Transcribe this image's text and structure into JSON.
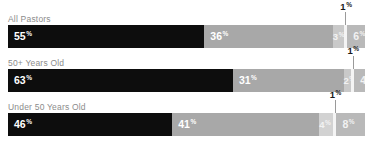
{
  "chart_data": {
    "type": "bar",
    "orientation": "horizontal",
    "stacked": true,
    "title": "",
    "subtitle": "",
    "xlabel": "",
    "ylabel": "",
    "xlim": [
      0,
      100
    ],
    "grid": false,
    "legend_position": "none",
    "units": "%",
    "categories": [
      "All Pastors",
      "50+ Years Old",
      "Under 50 Years Old"
    ],
    "series": [
      {
        "name": "Segment 1",
        "color": "#0d0d0d",
        "values": [
          55,
          63,
          46
        ]
      },
      {
        "name": "Segment 2",
        "color": "#a8a8a8",
        "values": [
          36,
          31,
          41
        ]
      },
      {
        "name": "Segment 3",
        "color": "#c9c9c9",
        "values": [
          3,
          2,
          4
        ]
      },
      {
        "name": "Segment 4",
        "color": "#f4f4f4",
        "values": [
          1,
          1,
          1
        ]
      },
      {
        "name": "Segment 5",
        "color": "#b9b9b9",
        "values": [
          6,
          4,
          8
        ]
      }
    ],
    "annotations": [
      {
        "text": "1%",
        "series": "Segment 4",
        "category": "All Pastors"
      },
      {
        "text": "1%",
        "series": "Segment 4",
        "category": "50+ Years Old"
      },
      {
        "text": "1%",
        "series": "Segment 4",
        "category": "Under 50 Years Old"
      }
    ]
  },
  "rows": [
    {
      "label": "All Pastors",
      "callout": "1",
      "callout_pct": "%",
      "segments": [
        {
          "value": "55",
          "pct": "%",
          "width": 55,
          "color": "#0d0d0d",
          "tone": "dark",
          "show_label": true,
          "narrow": false
        },
        {
          "value": "36",
          "pct": "%",
          "width": 36,
          "color": "#a8a8a8",
          "tone": "light",
          "show_label": true,
          "narrow": false
        },
        {
          "value": "3",
          "pct": "%",
          "width": 3,
          "color": "#c9c9c9",
          "tone": "pale",
          "show_label": true,
          "narrow": true
        },
        {
          "value": "1",
          "pct": "%",
          "width": 1,
          "color": "#f4f4f4",
          "tone": "pale",
          "show_label": false,
          "narrow": true
        },
        {
          "value": "6",
          "pct": "%",
          "width": 6,
          "color": "#b9b9b9",
          "tone": "pale",
          "show_label": true,
          "narrow": false
        }
      ]
    },
    {
      "label": "50+ Years Old",
      "callout": "1",
      "callout_pct": "%",
      "segments": [
        {
          "value": "63",
          "pct": "%",
          "width": 63,
          "color": "#0d0d0d",
          "tone": "dark",
          "show_label": true,
          "narrow": false
        },
        {
          "value": "31",
          "pct": "%",
          "width": 31,
          "color": "#a8a8a8",
          "tone": "light",
          "show_label": true,
          "narrow": false
        },
        {
          "value": "2",
          "pct": "%",
          "width": 2,
          "color": "#c9c9c9",
          "tone": "pale",
          "show_label": true,
          "narrow": true
        },
        {
          "value": "1",
          "pct": "%",
          "width": 1,
          "color": "#f4f4f4",
          "tone": "pale",
          "show_label": false,
          "narrow": true
        },
        {
          "value": "4",
          "pct": "%",
          "width": 4,
          "color": "#b9b9b9",
          "tone": "pale",
          "show_label": true,
          "narrow": false
        }
      ]
    },
    {
      "label": "Under 50 Years Old",
      "callout": "1",
      "callout_pct": "%",
      "segments": [
        {
          "value": "46",
          "pct": "%",
          "width": 46,
          "color": "#0d0d0d",
          "tone": "dark",
          "show_label": true,
          "narrow": false
        },
        {
          "value": "41",
          "pct": "%",
          "width": 41,
          "color": "#a8a8a8",
          "tone": "light",
          "show_label": true,
          "narrow": false
        },
        {
          "value": "4",
          "pct": "%",
          "width": 4,
          "color": "#d2d2d2",
          "tone": "pale",
          "show_label": true,
          "narrow": true
        },
        {
          "value": "1",
          "pct": "%",
          "width": 1,
          "color": "#f4f4f4",
          "tone": "pale",
          "show_label": false,
          "narrow": true
        },
        {
          "value": "8",
          "pct": "%",
          "width": 8,
          "color": "#b9b9b9",
          "tone": "pale",
          "show_label": true,
          "narrow": false
        }
      ]
    }
  ]
}
